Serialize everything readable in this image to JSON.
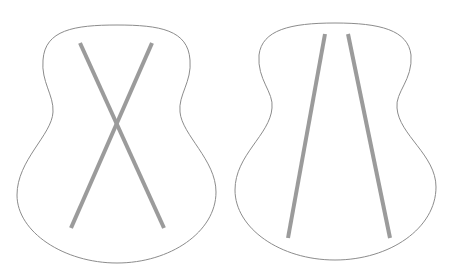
{
  "figure": {
    "colors": {
      "background": "#ffffff",
      "outline": "#8c8c8c",
      "brace": "#9b9b9b"
    },
    "panels": [
      {
        "name": "x-bracing",
        "braces": [
          {
            "x1": 80,
            "y1": 43,
            "x2": 164,
            "y2": 228
          },
          {
            "x1": 152,
            "y1": 43,
            "x2": 71,
            "y2": 228
          }
        ]
      },
      {
        "name": "parallel-bracing",
        "braces": [
          {
            "x1": 325,
            "y1": 34,
            "x2": 288,
            "y2": 238
          },
          {
            "x1": 348,
            "y1": 34,
            "x2": 390,
            "y2": 238
          }
        ]
      }
    ]
  }
}
